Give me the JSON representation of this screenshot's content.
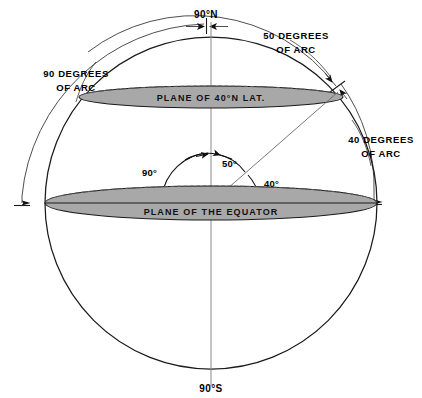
{
  "diagram": {
    "type": "geometric-cross-section",
    "labels": {
      "north_pole": "90°N",
      "south_pole": "90°S",
      "left_arc_line1": "90 DEGREES",
      "left_arc_line2": "OF ARC",
      "top_right_arc_line1": "50 DEGREES",
      "top_right_arc_line2": "OF ARC",
      "right_arc_line1": "40 DEGREES",
      "right_arc_line2": "OF ARC",
      "plane_of_latitude": "PLANE OF 40°N LAT.",
      "plane_of_equator": "PLANE OF THE EQUATOR",
      "angle_colatitude": "90°",
      "angle_pole_to_point": "50°",
      "angle_latitude": "40°"
    },
    "values": {
      "latitude_degrees": 40,
      "colatitude_degrees": 50,
      "quadrant_degrees": 90,
      "arc_equator_to_point_degrees": 40,
      "arc_pole_to_point_degrees": 50,
      "arc_pole_to_equator_degrees": 90
    },
    "colors": {
      "plane_fill": "#a8a8a8",
      "outline": "#1a1a1a",
      "axis": "#8a8a8a",
      "background": "#ffffff"
    }
  }
}
